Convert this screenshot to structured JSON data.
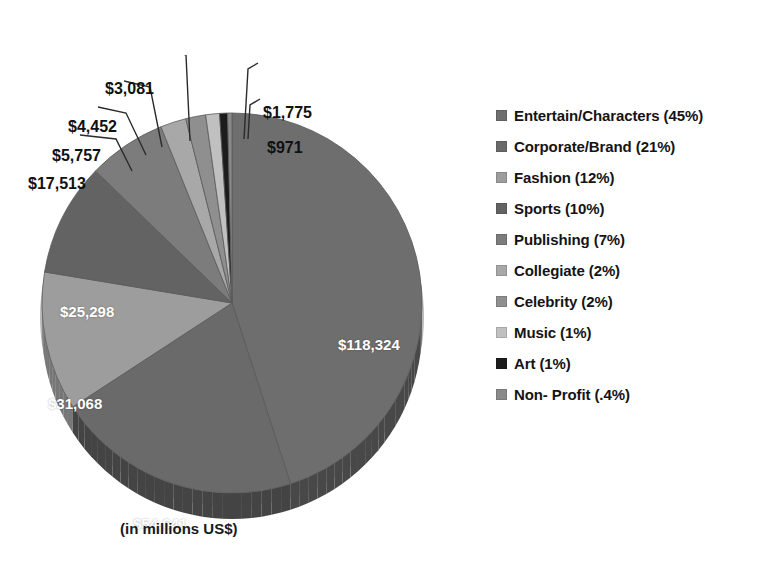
{
  "title": "",
  "caption": "(in millions US$)",
  "chart_data": {
    "type": "pie",
    "title": "",
    "subtitle": "",
    "xlabel": "",
    "ylabel": "",
    "units": "millions US$",
    "legend_position": "right",
    "grid": false,
    "categories": [
      "Entertain/Characters",
      "Corporate/Brand",
      "Fashion",
      "Sports",
      "Publishing",
      "Collegiate",
      "Celebrity",
      "Music",
      "Art",
      "Non- Profit"
    ],
    "values": [
      118324,
      54641,
      31068,
      25298,
      17513,
      5757,
      4452,
      3081,
      1775,
      971
    ],
    "value_labels": [
      "$118,324",
      "$54,641",
      "$31,068",
      "$25,298",
      "$17,513",
      "$5,757",
      "$4,452",
      "$3,081",
      "$1,775",
      "$971"
    ],
    "percents": [
      "45%",
      "21%",
      "12%",
      "10%",
      "7%",
      "2%",
      "2%",
      "1%",
      "1%",
      ".4%"
    ],
    "colors": [
      "#6e6e6e",
      "#6a6a6a",
      "#9d9d9d",
      "#636363",
      "#7c7c7c",
      "#a8a8a8",
      "#8f8f8f",
      "#c0c0c0",
      "#1c1c1c",
      "#8a8a8a"
    ],
    "legend_labels": [
      "Entertain/Characters (45%)",
      "Corporate/Brand (21%)",
      "Fashion (12%)",
      "Sports (10%)",
      "Publishing (7%)",
      "Collegiate (2%)",
      "Celebrity (2%)",
      "Music (1%)",
      "Art (1%)",
      "Non- Profit (.4%)"
    ]
  },
  "legend": {
    "items": [
      {
        "label": "Entertain/Characters (45%)",
        "color": "#6e6e6e"
      },
      {
        "label": "Corporate/Brand (21%)",
        "color": "#6a6a6a"
      },
      {
        "label": "Fashion (12%)",
        "color": "#9d9d9d"
      },
      {
        "label": "Sports (10%)",
        "color": "#636363"
      },
      {
        "label": "Publishing (7%)",
        "color": "#7c7c7c"
      },
      {
        "label": "Collegiate (2%)",
        "color": "#a8a8a8"
      },
      {
        "label": "Celebrity (2%)",
        "color": "#8f8f8f"
      },
      {
        "label": "Music (1%)",
        "color": "#c0c0c0"
      },
      {
        "label": "Art (1%)",
        "color": "#1c1c1c"
      },
      {
        "label": "Non- Profit (.4%)",
        "color": "#8a8a8a"
      }
    ]
  },
  "inner_labels": [
    {
      "text": "$118,324",
      "x": 318,
      "y": 281
    },
    {
      "text": "$54,641",
      "x": 113,
      "y": 460
    },
    {
      "text": "$31,068",
      "x": 28,
      "y": 340
    },
    {
      "text": "$25,298",
      "x": 40,
      "y": 248
    }
  ],
  "callouts": [
    {
      "text": "$17,513",
      "x": 8,
      "y": 120
    },
    {
      "text": "$5,757",
      "x": 32,
      "y": 92
    },
    {
      "text": "$4,452",
      "x": 48,
      "y": 63
    },
    {
      "text": "$3,081",
      "x": 85,
      "y": 25
    },
    {
      "text": "$1,775",
      "x": 243,
      "y": 49
    },
    {
      "text": "$971",
      "x": 247,
      "y": 84
    }
  ]
}
